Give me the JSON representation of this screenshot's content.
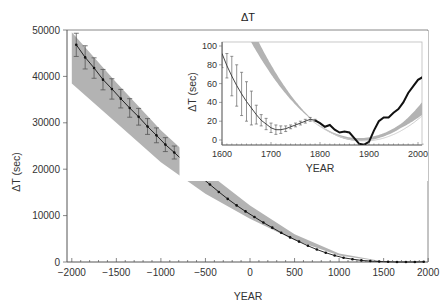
{
  "chart_data": [
    {
      "type": "line",
      "title": "ΔT",
      "xlabel": "YEAR",
      "ylabel": "ΔT (sec)",
      "xlim": [
        -2000,
        2000
      ],
      "ylim": [
        0,
        50000
      ],
      "xticks": [
        -2000,
        -1500,
        -1000,
        -500,
        0,
        500,
        1000,
        1500,
        2000
      ],
      "yticks": [
        0,
        10000,
        20000,
        30000,
        40000,
        50000
      ],
      "grid": false,
      "series": [
        {
          "name": "ΔT estimates (with error bars)",
          "color": "#111111",
          "x": [
            -1950,
            -1850,
            -1750,
            -1650,
            -1550,
            -1450,
            -1350,
            -1250,
            -1150,
            -1050,
            -950,
            -850,
            -750,
            -650,
            -550,
            -450,
            -350,
            -250,
            -150,
            -50,
            50,
            150,
            250,
            350,
            450,
            550,
            650,
            750,
            850,
            950,
            1050,
            1150,
            1250,
            1350,
            1450,
            1550,
            1650,
            1750,
            1850,
            1950
          ],
          "values": [
            46800,
            44100,
            41800,
            39300,
            37300,
            35200,
            33200,
            31300,
            29200,
            27300,
            25300,
            23600,
            21800,
            20000,
            18300,
            16700,
            15100,
            13600,
            12200,
            10900,
            9700,
            8500,
            7400,
            6300,
            5300,
            4400,
            3500,
            2700,
            2000,
            1400,
            900,
            600,
            350,
            200,
            100,
            40,
            10,
            10,
            5,
            50
          ],
          "error": [
            2500,
            2500,
            2200,
            2200,
            2200,
            2000,
            2000,
            1800,
            1700,
            1600,
            1500,
            1400,
            0,
            0,
            0,
            0,
            0,
            0,
            0,
            0,
            0,
            0,
            0,
            0,
            0,
            0,
            0,
            0,
            0,
            0,
            0,
            0,
            0,
            0,
            0,
            0,
            0,
            0,
            0,
            0
          ]
        },
        {
          "name": "parabolic band (upper)",
          "color": "#b0b0b0",
          "x": [
            -2000,
            -1500,
            -1000,
            -500,
            0,
            500,
            1000,
            1500,
            2000
          ],
          "values": [
            49500,
            38700,
            28400,
            19600,
            12200,
            6000,
            1800,
            100,
            50
          ]
        },
        {
          "name": "parabolic band (lower)",
          "color": "#b0b0b0",
          "x": [
            -2000,
            -1500,
            -1000,
            -500,
            0,
            500,
            1000,
            1500,
            2000
          ],
          "values": [
            38500,
            30000,
            21500,
            14700,
            9300,
            4700,
            1400,
            50,
            0
          ]
        }
      ]
    },
    {
      "type": "line",
      "title": "inset",
      "xlabel": "YEAR",
      "ylabel": "ΔT (sec)",
      "xlim": [
        1600,
        2010
      ],
      "ylim": [
        -5,
        105
      ],
      "xticks": [
        1600,
        1700,
        1800,
        1900,
        2000
      ],
      "yticks": [
        0,
        20,
        40,
        60,
        80,
        100
      ],
      "grid": false,
      "series": [
        {
          "name": "telescopic ΔT (with error bars)",
          "color": "#333333",
          "x": [
            1600,
            1610,
            1620,
            1630,
            1640,
            1650,
            1660,
            1670,
            1680,
            1690,
            1700,
            1710,
            1720,
            1730,
            1740,
            1750,
            1760,
            1770,
            1780,
            1790
          ],
          "values": [
            92,
            79,
            68,
            58,
            49,
            41,
            34,
            27,
            21,
            17,
            13,
            11,
            11,
            12,
            14,
            16,
            18,
            20,
            22,
            21
          ],
          "error": [
            15,
            13,
            21,
            22,
            23,
            21,
            18,
            10,
            6,
            6,
            5,
            5,
            4,
            3,
            2,
            2,
            2,
            2,
            2,
            1
          ]
        },
        {
          "name": "modern ΔT",
          "color": "#111111",
          "x": [
            1790,
            1800,
            1810,
            1820,
            1830,
            1840,
            1850,
            1860,
            1870,
            1880,
            1890,
            1900,
            1910,
            1920,
            1930,
            1940,
            1950,
            1960,
            1970,
            1980,
            1990,
            2000,
            2010
          ],
          "values": [
            21,
            18,
            14,
            16,
            11,
            8,
            9,
            8,
            2,
            -4,
            -5,
            -2,
            10,
            20,
            24,
            24,
            29,
            33,
            40,
            50,
            57,
            64,
            67
          ]
        },
        {
          "name": "parabolic band (upper)",
          "color": "#b0b0b0",
          "x": [
            1660,
            1700,
            1750,
            1800,
            1850,
            1900,
            1950,
            2000,
            2010
          ],
          "values": [
            105,
            75,
            43,
            20,
            6,
            2,
            12,
            55,
            70
          ]
        },
        {
          "name": "parabolic band (lower)",
          "color": "#b0b0b0",
          "x": [
            1678,
            1700,
            1750,
            1800,
            1850,
            1900,
            1950,
            2000,
            2010
          ],
          "values": [
            105,
            86,
            48,
            19,
            3,
            -1,
            8,
            44,
            57
          ]
        }
      ]
    }
  ],
  "main": {
    "title": "ΔT",
    "xlabel": "YEAR",
    "ylabel": "ΔT (sec)",
    "xtick_labels": [
      "−2000",
      "−1500",
      "−1000",
      "−500",
      "0",
      "500",
      "1000",
      "1500",
      "2000"
    ],
    "ytick_labels": [
      "0",
      "10000",
      "20000",
      "30000",
      "40000",
      "50000"
    ]
  },
  "inset": {
    "xlabel": "YEAR",
    "ylabel": "ΔT (sec)",
    "xtick_labels": [
      "1600",
      "1700",
      "1800",
      "1900",
      "2000"
    ],
    "ytick_labels": [
      "0",
      "20",
      "40",
      "60",
      "80",
      "100"
    ]
  },
  "colors": {
    "band": "#b3b3b3",
    "line": "#111111",
    "axis": "#555555",
    "frame": "#888888"
  }
}
